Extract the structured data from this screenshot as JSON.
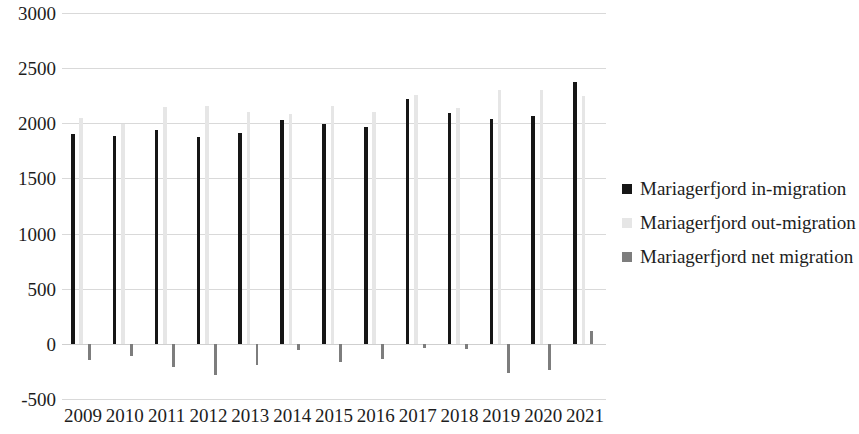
{
  "chart_data": {
    "type": "bar",
    "title": "",
    "subtitle": "",
    "xlabel": "",
    "ylabel": "",
    "ylim": [
      -500,
      3000
    ],
    "ytick_step": 500,
    "yticks": [
      "3000",
      "2500",
      "2000",
      "1500",
      "1000",
      "500",
      "0",
      "-500"
    ],
    "grid": true,
    "legend_position": "right",
    "categories": [
      "2009",
      "2010",
      "2011",
      "2012",
      "2013",
      "2014",
      "2015",
      "2016",
      "2017",
      "2018",
      "2019",
      "2020",
      "2021"
    ],
    "series": [
      {
        "name": "Mariagerfjord in-migration",
        "color": "#161616",
        "values": [
          1900,
          1885,
          1940,
          1880,
          1915,
          2030,
          1990,
          1965,
          2220,
          2095,
          2040,
          2065,
          2370
        ]
      },
      {
        "name": "Mariagerfjord out-migration",
        "color": "#e6e6e6",
        "values": [
          2050,
          1995,
          2150,
          2160,
          2105,
          2085,
          2155,
          2105,
          2255,
          2140,
          2305,
          2305,
          2250
        ]
      },
      {
        "name": "Mariagerfjord net migration",
        "color": "#7d7d7d",
        "values": [
          -150,
          -110,
          -210,
          -280,
          -190,
          -55,
          -165,
          -140,
          -35,
          -45,
          -265,
          -240,
          120
        ]
      }
    ]
  },
  "legend": {
    "items": [
      {
        "label": "Mariagerfjord in-migration",
        "color": "#161616"
      },
      {
        "label": "Mariagerfjord out-migration",
        "color": "#e6e6e6"
      },
      {
        "label": "Mariagerfjord net migration",
        "color": "#7d7d7d"
      }
    ]
  },
  "axes": {
    "y_tick_labels": [
      "3000",
      "2500",
      "2000",
      "1500",
      "1000",
      "500",
      "0",
      "-500"
    ],
    "x_tick_labels": [
      "2009",
      "2010",
      "2011",
      "2012",
      "2013",
      "2014",
      "2015",
      "2016",
      "2017",
      "2018",
      "2019",
      "2020",
      "2021"
    ]
  }
}
